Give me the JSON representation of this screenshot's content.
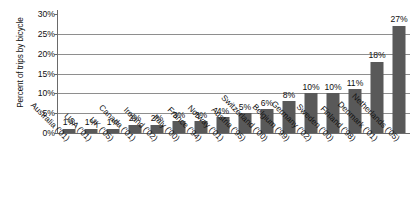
{
  "chart_data": {
    "type": "bar",
    "title": "",
    "subtitle": "",
    "xlabel": "",
    "ylabel": "Percent of trips by bicycle",
    "ylim": [
      0,
      30
    ],
    "ytick_values": [
      0,
      5,
      10,
      15,
      20,
      25,
      30
    ],
    "ytick_labels": [
      "0%",
      "5%",
      "10%",
      "15%",
      "20%",
      "25%",
      "30%"
    ],
    "grid": "horizontal",
    "legend": "none",
    "bar_color": "#595959",
    "gridline_color": "#8e8e8e",
    "axis_color": "#6a6a6a",
    "background": "#ffffff",
    "categories": [
      "Australia ('01)",
      "USA ('01)",
      "UK ('05)",
      "Canada ('01)",
      "Ireland ('02)",
      "Italy ('00)",
      "France ('94)",
      "Norway ('01)",
      "Austria ('95)",
      "Switzerland ('00)",
      "Belgium ('99)",
      "Germany ('02)",
      "Sweden ('00)",
      "Finland ('98)",
      "Denmark ('01)",
      "Netherlands ('05)"
    ],
    "values": [
      1,
      1,
      1,
      2,
      2,
      3,
      3,
      4,
      5,
      6,
      8,
      10,
      10,
      11,
      18,
      27
    ],
    "data_labels": [
      "1%",
      "1%",
      "1%",
      "2%",
      "2%",
      "3%",
      "3%",
      "4%",
      "5%",
      "6%",
      "8%",
      "10%",
      "10%",
      "11%",
      "18%",
      "27%"
    ]
  }
}
